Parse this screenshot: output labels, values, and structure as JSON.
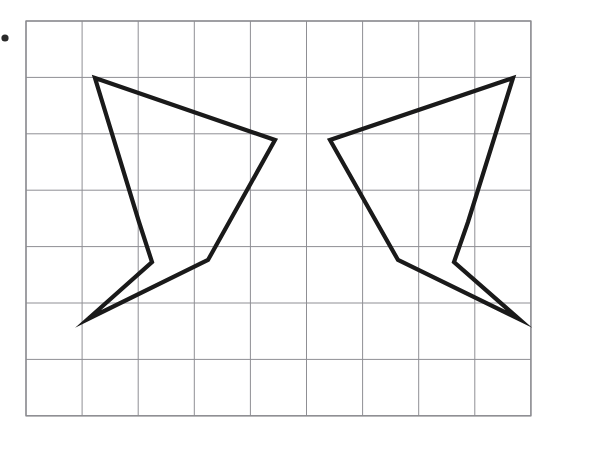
{
  "figure": {
    "background_color": "#ffffff",
    "grid": {
      "line_color": "#8f8f94",
      "border_color": "#8a8a8f",
      "line_width": 1.0,
      "border_width": 1.3,
      "origin_x": 26,
      "origin_y": 21,
      "cell_width": 56.1,
      "cell_height": 56.4,
      "columns": 9,
      "rows": 7,
      "x_lines": [
        26,
        82.1,
        138.2,
        194.3,
        250.4,
        306.5,
        362.6,
        418.7,
        474.8,
        530.9
      ],
      "y_lines": [
        21,
        77.4,
        133.8,
        190.2,
        246.6,
        303.0,
        359.4,
        415.8
      ]
    },
    "shapes": [
      {
        "name": "left-polygon",
        "label": "left mirrored arrow polygon",
        "stroke_color": "#1a1a1a",
        "stroke_width": 4.2,
        "fill": "none",
        "closed": true,
        "points": [
          [
            95,
            78
          ],
          [
            275,
            140
          ],
          [
            208,
            260
          ],
          [
            88,
            319
          ],
          [
            152,
            262
          ],
          [
            139,
            222
          ]
        ]
      },
      {
        "name": "right-polygon",
        "label": "right mirrored arrow polygon",
        "stroke_color": "#1a1a1a",
        "stroke_width": 4.2,
        "fill": "none",
        "closed": true,
        "points": [
          [
            513,
            78
          ],
          [
            330,
            140
          ],
          [
            398,
            260
          ],
          [
            519,
            319
          ],
          [
            454,
            262
          ],
          [
            468,
            222
          ]
        ]
      }
    ],
    "marks": [
      {
        "name": "margin-dot",
        "label": "small dot in left margin",
        "x": 5,
        "y": 38,
        "radius": 3.6,
        "color": "#2a2a2a"
      }
    ]
  }
}
